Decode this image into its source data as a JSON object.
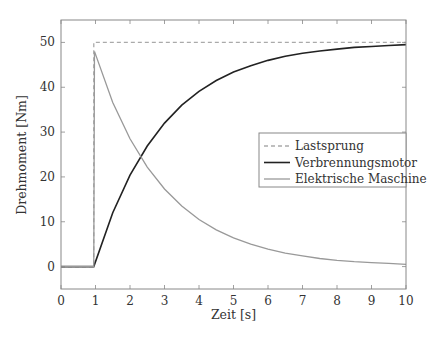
{
  "chart_data": {
    "type": "line",
    "title": "",
    "xlabel": "Zeit [s]",
    "ylabel": "Drehmoment [Nm]",
    "xlim": [
      0,
      10
    ],
    "ylim": [
      -5,
      55
    ],
    "xticks": [
      0,
      1,
      2,
      3,
      4,
      5,
      6,
      7,
      8,
      9,
      10
    ],
    "yticks": [
      0,
      10,
      20,
      30,
      40,
      50
    ],
    "grid": false,
    "legend_position": "center-right",
    "series": [
      {
        "name": "Lastsprung",
        "style": "dashed",
        "color": "#aaaaaa",
        "x": [
          0,
          0.95,
          0.95,
          10
        ],
        "y": [
          0,
          0,
          50,
          50
        ]
      },
      {
        "name": "Verbrennungsmotor",
        "style": "solid",
        "color": "#222222",
        "x": [
          0,
          0.95,
          1.5,
          2,
          2.5,
          3,
          3.5,
          4,
          4.5,
          5,
          5.5,
          6,
          6.5,
          7,
          7.5,
          8,
          8.5,
          9,
          9.5,
          10
        ],
        "y": [
          0,
          0,
          12.0,
          20.4,
          26.9,
          32.0,
          36.0,
          39.1,
          41.5,
          43.4,
          44.8,
          46.0,
          46.9,
          47.6,
          48.1,
          48.5,
          48.9,
          49.1,
          49.3,
          49.5
        ]
      },
      {
        "name": "Elektrische Maschine",
        "style": "solid",
        "color": "#999999",
        "x": [
          0,
          0.95,
          0.97,
          1.5,
          2,
          2.5,
          3,
          3.5,
          4,
          4.5,
          5,
          5.5,
          6,
          6.5,
          7,
          7.5,
          8,
          8.5,
          9,
          9.5,
          10
        ],
        "y": [
          0,
          0,
          48,
          36.6,
          28.5,
          22.2,
          17.3,
          13.5,
          10.5,
          8.2,
          6.4,
          5.0,
          3.9,
          3.0,
          2.4,
          1.8,
          1.4,
          1.1,
          0.9,
          0.7,
          0.5
        ]
      }
    ]
  }
}
